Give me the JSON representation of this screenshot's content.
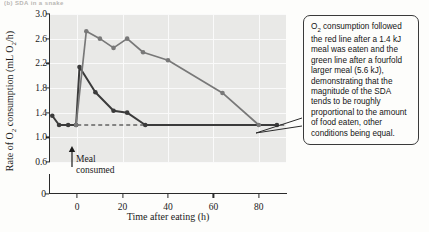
{
  "header": {
    "caption_fragment": "(b) SDA in a snake"
  },
  "chart_data": {
    "type": "line",
    "title": "",
    "xlabel": "Time after eating (h)",
    "ylabel": "Rate of O2 consumption (mL O2/h)",
    "xlim": [
      -12,
      92
    ],
    "ylim": [
      0.6,
      3.0
    ],
    "y_axis_break": true,
    "y_zero_shown": true,
    "xticks": [
      0,
      20,
      40,
      60,
      80
    ],
    "yticks": [
      0.6,
      1.0,
      1.4,
      1.8,
      2.2,
      2.6,
      3.0
    ],
    "ytick_zero": "0",
    "grid": "both",
    "legend": "none",
    "baseline_value": 1.2,
    "annotations": [
      {
        "name": "meal-consumed",
        "text_line1": "Meal",
        "text_line2": "consumed",
        "x": 0
      }
    ],
    "series": [
      {
        "name": "small-meal-1.4kJ",
        "described_color": "red",
        "printed_color": "#3b3b3b",
        "marker": "circle",
        "points": [
          {
            "x": -11,
            "y": 1.35
          },
          {
            "x": -8,
            "y": 1.2
          },
          {
            "x": -4,
            "y": 1.2
          },
          {
            "x": -0.5,
            "y": 1.2
          },
          {
            "x": 1,
            "y": 2.14
          },
          {
            "x": 8,
            "y": 1.73
          },
          {
            "x": 16,
            "y": 1.43
          },
          {
            "x": 22,
            "y": 1.4
          },
          {
            "x": 30,
            "y": 1.2
          },
          {
            "x": 88,
            "y": 1.2
          }
        ]
      },
      {
        "name": "large-meal-5.6kJ",
        "described_color": "green",
        "printed_color": "#787878",
        "marker": "circle",
        "points": [
          {
            "x": -0.5,
            "y": 1.2
          },
          {
            "x": 4,
            "y": 2.72
          },
          {
            "x": 10,
            "y": 2.6
          },
          {
            "x": 16,
            "y": 2.45
          },
          {
            "x": 22,
            "y": 2.6
          },
          {
            "x": 29,
            "y": 2.38
          },
          {
            "x": 40,
            "y": 2.25
          },
          {
            "x": 64,
            "y": 1.72
          },
          {
            "x": 80,
            "y": 1.2
          }
        ]
      }
    ]
  },
  "callout": {
    "text": "O2 consumption followed the red line after a 1.4 kJ meal was eaten and the green line after a fourfold larger meal (5.6 kJ), demonstrating that the magnitude of the SDA tends to be roughly proportional to the amount of food eaten, other conditions being equal.",
    "segments": {
      "s1": "O",
      "sub1": "2",
      "s2": " consumption followed the red line after a 1.4 kJ meal was eaten and the green line after a fourfold larger meal (5.6 kJ), demonstrating that the magnitude of the SDA tends to be roughly proportional to the amount of food eaten, other conditions being equal."
    }
  },
  "axis_text": {
    "y_prefix": "Rate of O",
    "y_sub1": "2",
    "y_mid": " consumption (mL O",
    "y_sub2": "2",
    "y_suffix": "/h)"
  }
}
